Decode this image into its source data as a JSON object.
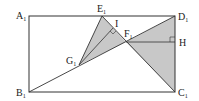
{
  "diagram": {
    "type": "geometry",
    "colors": {
      "line": "#333333",
      "fill": "#c8c8c8",
      "background": "#ffffff"
    },
    "points": {
      "A1": {
        "label": "A",
        "sub": "1",
        "x": 29,
        "y": 16
      },
      "B1": {
        "label": "B",
        "sub": "1",
        "x": 29,
        "y": 92
      },
      "C1": {
        "label": "C",
        "sub": "1",
        "x": 175,
        "y": 92
      },
      "D1": {
        "label": "D",
        "sub": "1",
        "x": 175,
        "y": 16
      },
      "E1": {
        "label": "E",
        "sub": "1",
        "x": 102,
        "y": 16
      },
      "F1": {
        "label": "F",
        "sub": "1",
        "x": 126,
        "y": 42
      },
      "G1": {
        "label": "G",
        "sub": "1",
        "x": 79,
        "y": 65
      },
      "I": {
        "label": "I",
        "sub": "",
        "x": 113,
        "y": 28
      },
      "H": {
        "label": "H",
        "sub": "",
        "x": 175,
        "y": 42
      }
    },
    "shaded_regions": [
      "triangle G1E1F1",
      "triangle F1D1C1"
    ],
    "right_angle_marks": [
      "I",
      "H"
    ]
  }
}
